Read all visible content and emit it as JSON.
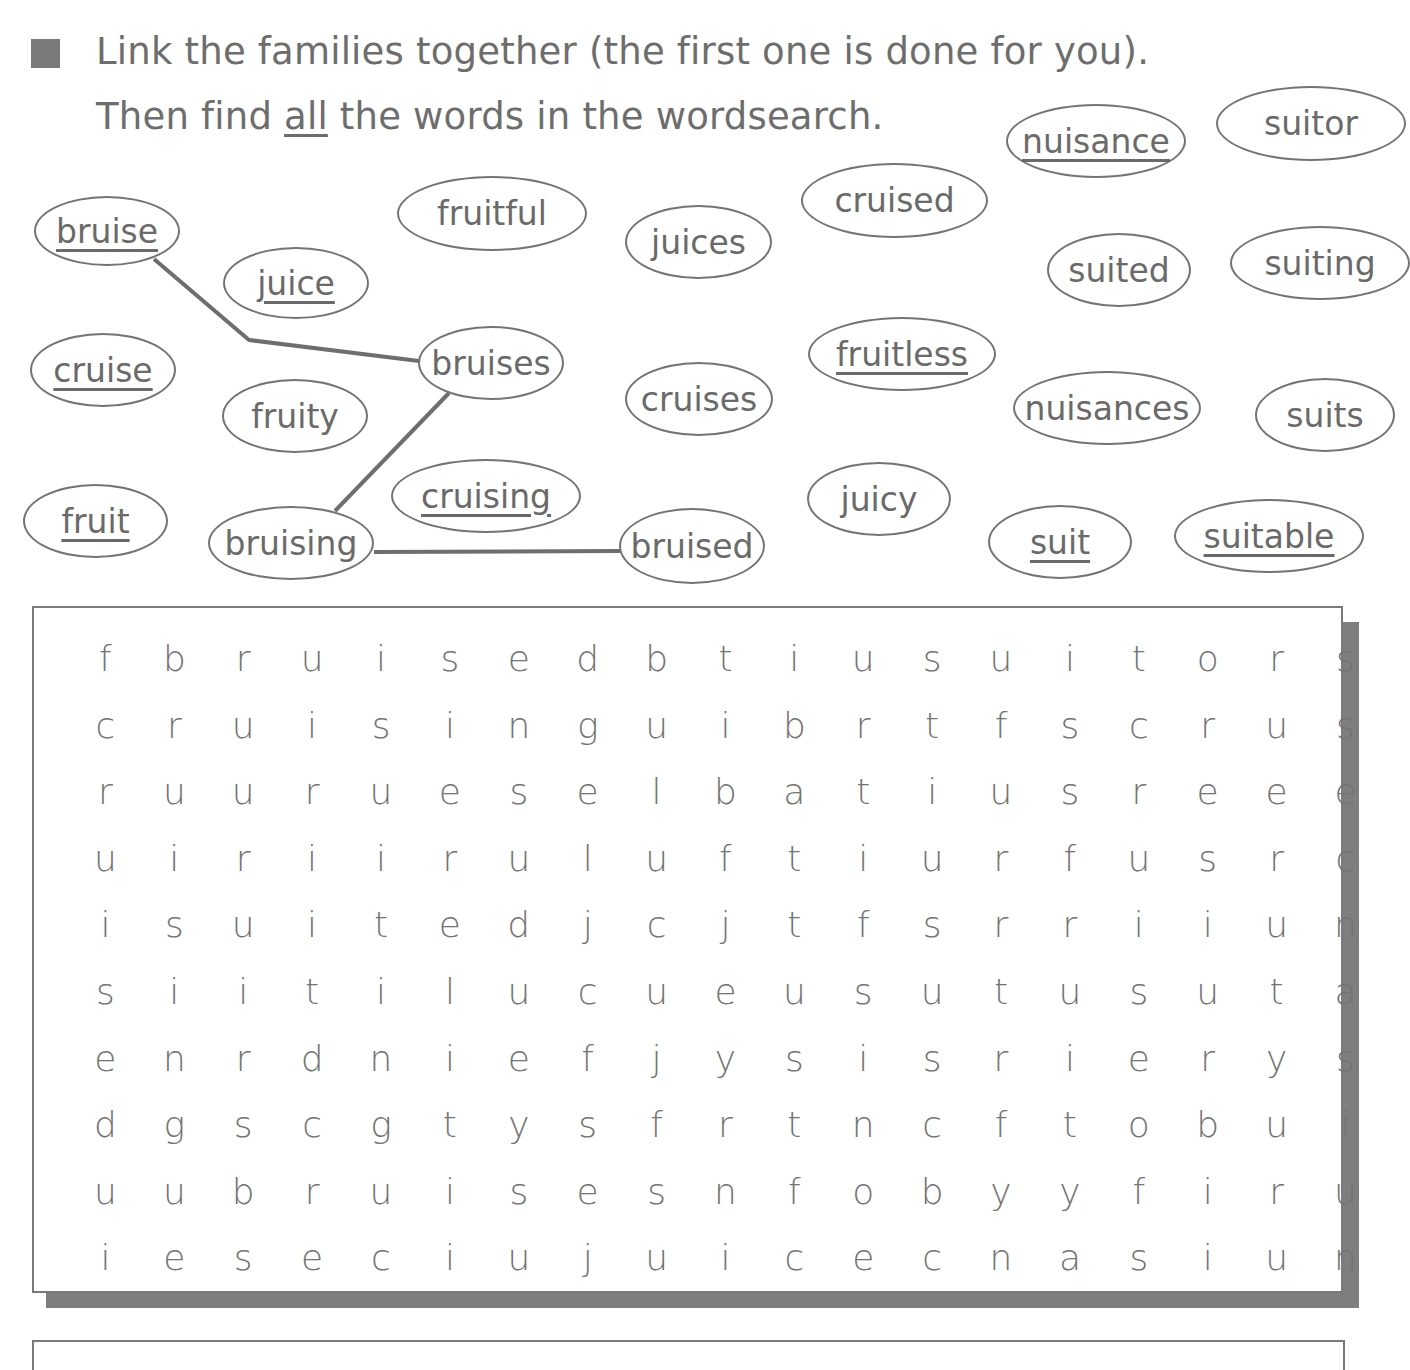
{
  "instructions": {
    "line1": "Link the families together (the first one is done for you).",
    "line2_pre": "Then find ",
    "line2_emph": "all",
    "line2_post": " the words in the wordsearch."
  },
  "ovals": [
    {
      "id": "bruise",
      "label": "bruise",
      "underlined": true,
      "x": 34,
      "y": 196,
      "w": 146,
      "h": 70
    },
    {
      "id": "juice",
      "label": "juice",
      "underlined": true,
      "x": 223,
      "y": 247,
      "w": 146,
      "h": 72
    },
    {
      "id": "fruitful",
      "label": "fruitful",
      "underlined": false,
      "x": 397,
      "y": 176,
      "w": 190,
      "h": 75
    },
    {
      "id": "juices",
      "label": "juices",
      "underlined": false,
      "x": 625,
      "y": 205,
      "w": 147,
      "h": 74
    },
    {
      "id": "cruised",
      "label": "cruised",
      "underlined": false,
      "x": 801,
      "y": 163,
      "w": 187,
      "h": 75
    },
    {
      "id": "nuisance",
      "label": "nuisance",
      "underlined": true,
      "x": 1006,
      "y": 104,
      "w": 180,
      "h": 74
    },
    {
      "id": "suitor",
      "label": "suitor",
      "underlined": false,
      "x": 1216,
      "y": 86,
      "w": 190,
      "h": 75
    },
    {
      "id": "suited",
      "label": "suited",
      "underlined": false,
      "x": 1047,
      "y": 233,
      "w": 144,
      "h": 74
    },
    {
      "id": "suiting",
      "label": "suiting",
      "underlined": false,
      "x": 1230,
      "y": 226,
      "w": 180,
      "h": 74
    },
    {
      "id": "cruise",
      "label": "cruise",
      "underlined": true,
      "x": 30,
      "y": 333,
      "w": 146,
      "h": 74
    },
    {
      "id": "bruises",
      "label": "bruises",
      "underlined": false,
      "x": 418,
      "y": 326,
      "w": 146,
      "h": 74
    },
    {
      "id": "fruity",
      "label": "fruity",
      "underlined": false,
      "x": 222,
      "y": 379,
      "w": 146,
      "h": 74
    },
    {
      "id": "cruises",
      "label": "cruises",
      "underlined": false,
      "x": 625,
      "y": 362,
      "w": 148,
      "h": 74
    },
    {
      "id": "fruitless",
      "label": "fruitless",
      "underlined": true,
      "x": 808,
      "y": 317,
      "w": 188,
      "h": 74
    },
    {
      "id": "nuisances",
      "label": "nuisances",
      "underlined": false,
      "x": 1013,
      "y": 371,
      "w": 188,
      "h": 74
    },
    {
      "id": "suits",
      "label": "suits",
      "underlined": false,
      "x": 1255,
      "y": 378,
      "w": 140,
      "h": 74
    },
    {
      "id": "fruit",
      "label": "fruit",
      "underlined": true,
      "x": 23,
      "y": 484,
      "w": 145,
      "h": 74
    },
    {
      "id": "bruising",
      "label": "bruising",
      "underlined": false,
      "x": 208,
      "y": 506,
      "w": 166,
      "h": 74
    },
    {
      "id": "cruising",
      "label": "cruising",
      "underlined": true,
      "x": 391,
      "y": 459,
      "w": 190,
      "h": 74
    },
    {
      "id": "bruised",
      "label": "bruised",
      "underlined": false,
      "x": 619,
      "y": 508,
      "w": 146,
      "h": 76
    },
    {
      "id": "juicy",
      "label": "juicy",
      "underlined": false,
      "x": 807,
      "y": 462,
      "w": 144,
      "h": 74
    },
    {
      "id": "suit",
      "label": "suit",
      "underlined": true,
      "x": 988,
      "y": 505,
      "w": 144,
      "h": 74
    },
    {
      "id": "suitable",
      "label": "suitable",
      "underlined": true,
      "x": 1174,
      "y": 499,
      "w": 190,
      "h": 74
    }
  ],
  "links": [
    {
      "from": "bruise",
      "to": "bruises",
      "points": "154,259 249,340 419,361"
    },
    {
      "from": "bruises",
      "to": "bruising",
      "points": "449,393 335,511"
    },
    {
      "from": "bruising",
      "to": "bruised",
      "points": "374,552 620,551"
    }
  ],
  "wordsearch": {
    "rows": [
      [
        "f",
        "b",
        "r",
        "u",
        "i",
        "s",
        "e",
        "d",
        "b",
        "t",
        "i",
        "u",
        "s",
        "u",
        "i",
        "t",
        "o",
        "r",
        "s"
      ],
      [
        "c",
        "r",
        "u",
        "i",
        "s",
        "i",
        "n",
        "g",
        "u",
        "i",
        "b",
        "r",
        "t",
        "f",
        "s",
        "c",
        "r",
        "u",
        "s"
      ],
      [
        "r",
        "u",
        "u",
        "r",
        "u",
        "e",
        "s",
        "e",
        "l",
        "b",
        "a",
        "t",
        "i",
        "u",
        "s",
        "r",
        "e",
        "e",
        "e"
      ],
      [
        "u",
        "i",
        "r",
        "i",
        "i",
        "r",
        "u",
        "l",
        "u",
        "f",
        "t",
        "i",
        "u",
        "r",
        "f",
        "u",
        "s",
        "r",
        "c"
      ],
      [
        "i",
        "s",
        "u",
        "i",
        "t",
        "e",
        "d",
        "j",
        "c",
        "j",
        "t",
        "f",
        "s",
        "r",
        "r",
        "i",
        "i",
        "u",
        "n"
      ],
      [
        "s",
        "i",
        "i",
        "t",
        "i",
        "l",
        "u",
        "c",
        "u",
        "e",
        "u",
        "s",
        "u",
        "t",
        "u",
        "s",
        "u",
        "t",
        "a"
      ],
      [
        "e",
        "n",
        "r",
        "d",
        "n",
        "i",
        "e",
        "f",
        "j",
        "y",
        "s",
        "i",
        "s",
        "r",
        "i",
        "e",
        "r",
        "y",
        "s"
      ],
      [
        "d",
        "g",
        "s",
        "c",
        "g",
        "t",
        "y",
        "s",
        "f",
        "r",
        "t",
        "n",
        "c",
        "f",
        "t",
        "o",
        "b",
        "u",
        "i"
      ],
      [
        "u",
        "u",
        "b",
        "r",
        "u",
        "i",
        "s",
        "e",
        "s",
        "n",
        "f",
        "o",
        "b",
        "y",
        "y",
        "f",
        "i",
        "r",
        "u"
      ],
      [
        "i",
        "e",
        "s",
        "e",
        "c",
        "i",
        "u",
        "j",
        "u",
        "i",
        "c",
        "e",
        "c",
        "n",
        "a",
        "s",
        "i",
        "u",
        "n"
      ]
    ]
  },
  "colors": {
    "text": "#6b6b6b",
    "border": "#747474",
    "shadow": "#7e7e7e",
    "bullet": "#7a7a7a"
  },
  "icons": {
    "bullet": "square-bullet-icon"
  }
}
